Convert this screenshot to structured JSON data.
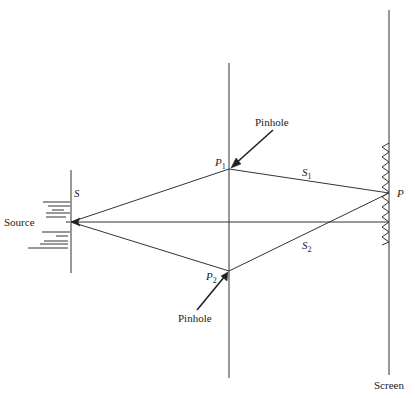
{
  "diagram": {
    "labels": {
      "source": "Source",
      "source_point": "S",
      "pinhole_top": "Pinhole",
      "pinhole_bottom": "Pinhole",
      "p1_main": "P",
      "p1_sub": "1",
      "p2_main": "P",
      "p2_sub": "2",
      "s1_main": "S",
      "s1_sub": "1",
      "s2_main": "S",
      "s2_sub": "2",
      "screen_point": "P",
      "screen": "Screen"
    },
    "colors": {
      "line": "#333333",
      "background": "#ffffff"
    },
    "geometry": {
      "source_point": [
        71,
        222
      ],
      "p1": [
        229,
        169
      ],
      "p2": [
        229,
        271
      ],
      "screen_point": [
        389,
        193
      ],
      "source_barrier_x": 71,
      "pinhole_barrier_x": 229,
      "screen_x": 389
    }
  }
}
